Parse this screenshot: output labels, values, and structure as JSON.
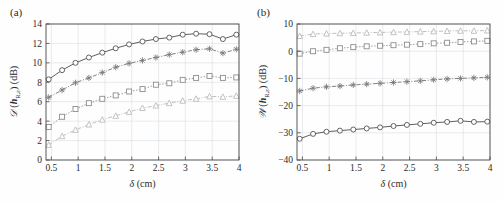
{
  "figure": {
    "background": "#fefefe",
    "panels": [
      {
        "tag": "(a)"
      },
      {
        "tag": "(b)"
      }
    ]
  },
  "chart_data": [
    {
      "type": "line",
      "panel_tag": "(a)",
      "title": "",
      "xlabel": "δ (cm)",
      "ylabel": "𝒟(h_{R,ε}) (dB)",
      "ylabel_parts": {
        "script": "𝒟",
        "open": "(",
        "vec": "h",
        "sub": "R,ε",
        "close": ")",
        "unit": "(dB)"
      },
      "xlabel_parts": {
        "sym": "δ",
        "unit": "(cm)"
      },
      "xlim": [
        0.4,
        4.0
      ],
      "ylim": [
        0,
        14
      ],
      "xticks": [
        0.5,
        1,
        1.5,
        2,
        2.5,
        3,
        3.5,
        4
      ],
      "xticklabels": [
        "0.5",
        "1",
        "1.5",
        "2",
        "2.5",
        "3",
        "3.5",
        "4"
      ],
      "yticks": [
        0,
        2,
        4,
        6,
        8,
        10,
        12,
        14
      ],
      "yticklabels": [
        "0",
        "2",
        "4",
        "6",
        "8",
        "10",
        "12",
        "14"
      ],
      "grid": true,
      "legend": "none",
      "x": [
        0.45,
        0.7,
        0.95,
        1.2,
        1.45,
        1.7,
        1.95,
        2.2,
        2.45,
        2.7,
        2.95,
        3.2,
        3.45,
        3.7,
        3.95
      ],
      "series": [
        {
          "name": "curve-1",
          "marker": "circle",
          "linestyle": "solid",
          "color": "#555555",
          "values": [
            8.3,
            9.25,
            10.0,
            10.55,
            11.05,
            11.5,
            11.9,
            12.2,
            12.45,
            12.6,
            12.9,
            13.0,
            12.95,
            12.45,
            12.9
          ]
        },
        {
          "name": "curve-2",
          "marker": "asterisk",
          "linestyle": "dashdot",
          "color": "#7a7a7a",
          "values": [
            6.45,
            7.2,
            7.95,
            8.45,
            9.0,
            9.55,
            9.95,
            10.25,
            10.55,
            10.85,
            11.1,
            11.35,
            11.45,
            11.0,
            11.4
          ]
        },
        {
          "name": "curve-3",
          "marker": "square",
          "linestyle": "dotted",
          "color": "#8d8d8d",
          "values": [
            3.4,
            4.45,
            5.25,
            5.85,
            6.3,
            6.65,
            7.05,
            7.3,
            7.75,
            7.9,
            8.25,
            8.45,
            8.65,
            8.45,
            8.5
          ]
        },
        {
          "name": "curve-4",
          "marker": "triangle",
          "linestyle": "dashdot",
          "color": "#bcbcbc",
          "values": [
            1.55,
            2.45,
            3.1,
            3.65,
            4.15,
            4.55,
            4.95,
            5.35,
            5.6,
            5.85,
            6.1,
            6.3,
            6.55,
            6.5,
            6.6
          ]
        }
      ]
    },
    {
      "type": "line",
      "panel_tag": "(b)",
      "title": "",
      "xlabel": "δ (cm)",
      "ylabel": "𝒲(h_{R,ε}) (dB)",
      "ylabel_parts": {
        "script": "𝒲",
        "open": "(",
        "vec": "h",
        "sub": "R,ε",
        "close": ")",
        "unit": "(dB)"
      },
      "xlabel_parts": {
        "sym": "δ",
        "unit": "(cm)"
      },
      "xlim": [
        0.4,
        4.0
      ],
      "ylim": [
        -40,
        10
      ],
      "xticks": [
        0.5,
        1,
        1.5,
        2,
        2.5,
        3,
        3.5,
        4
      ],
      "xticklabels": [
        "0.5",
        "1",
        "1.5",
        "2",
        "2.5",
        "3",
        "3.5",
        "4"
      ],
      "yticks": [
        -40,
        -30,
        -20,
        -10,
        0,
        10
      ],
      "yticklabels": [
        "−40",
        "−30",
        "−20",
        "−10",
        "0",
        "10"
      ],
      "grid": true,
      "legend": "none",
      "x": [
        0.45,
        0.7,
        0.95,
        1.2,
        1.45,
        1.7,
        1.95,
        2.2,
        2.45,
        2.7,
        2.95,
        3.2,
        3.45,
        3.7,
        3.95
      ],
      "series": [
        {
          "name": "curve-1",
          "marker": "triangle",
          "linestyle": "dashdot",
          "color": "#bcbcbc",
          "values": [
            5.6,
            6.3,
            6.5,
            6.6,
            6.7,
            6.8,
            6.9,
            7.0,
            7.1,
            7.2,
            7.3,
            7.4,
            7.5,
            7.5,
            7.6
          ]
        },
        {
          "name": "curve-2",
          "marker": "square",
          "linestyle": "dotted",
          "color": "#8d8d8d",
          "values": [
            -0.9,
            0.0,
            0.5,
            1.1,
            1.5,
            1.8,
            2.0,
            2.2,
            2.4,
            2.6,
            2.9,
            3.1,
            3.4,
            3.6,
            3.8
          ]
        },
        {
          "name": "curve-3",
          "marker": "asterisk",
          "linestyle": "dashdot",
          "color": "#7a7a7a",
          "values": [
            -14.6,
            -13.6,
            -13.1,
            -12.8,
            -12.4,
            -12.1,
            -11.8,
            -11.5,
            -11.2,
            -10.9,
            -10.5,
            -10.2,
            -10.0,
            -9.8,
            -9.6
          ]
        },
        {
          "name": "curve-4",
          "marker": "circle",
          "linestyle": "solid",
          "color": "#555555",
          "values": [
            -32.2,
            -30.4,
            -29.6,
            -29.2,
            -28.8,
            -28.4,
            -28.0,
            -27.5,
            -27.1,
            -26.7,
            -26.3,
            -26.0,
            -25.6,
            -26.0,
            -25.9
          ]
        }
      ]
    }
  ]
}
